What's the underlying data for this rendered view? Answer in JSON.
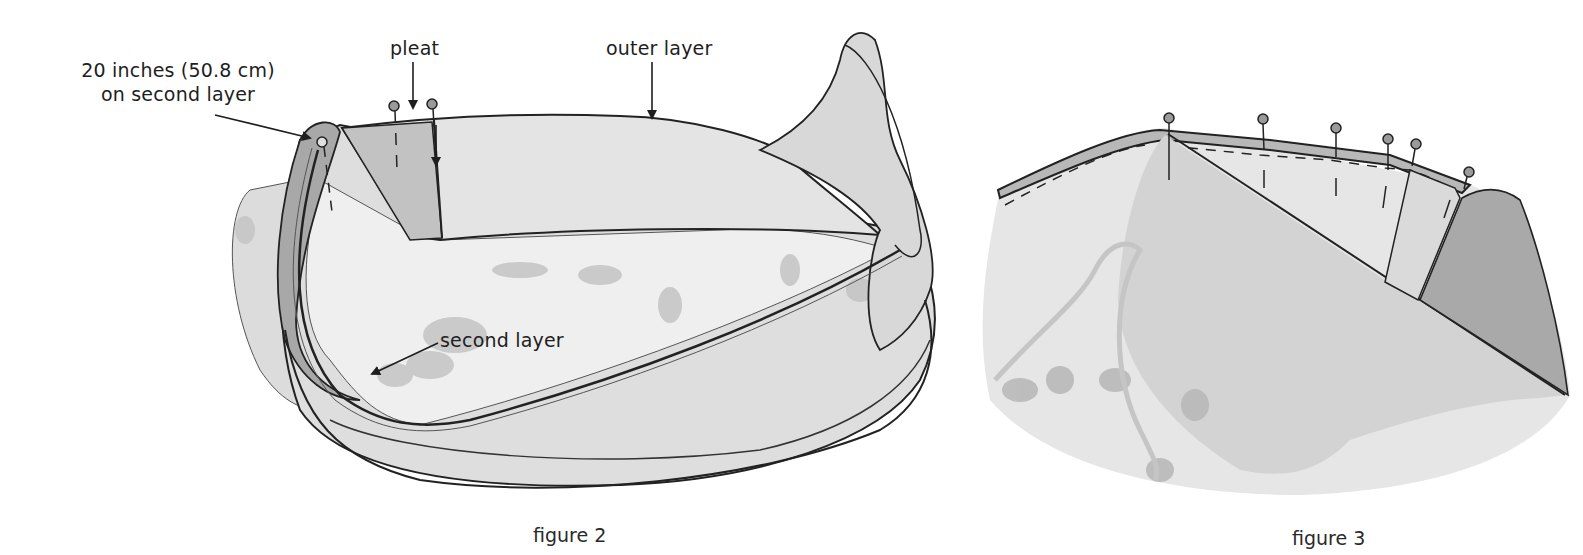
{
  "figures": [
    {
      "caption": "figure 2",
      "labels": {
        "measurement_line1": "20 inches (50.8 cm)",
        "measurement_line2": "on second layer",
        "pleat": "pleat",
        "outer_layer": "outer layer",
        "second_layer": "second layer"
      }
    },
    {
      "caption": "figure 3",
      "pin_count": 6
    }
  ],
  "colors": {
    "ink": "#1e1e1e",
    "fabric_light": "#e9e9e9",
    "fabric_mid": "#cfcfcf",
    "fabric_dark": "#a9a9a9",
    "pattern": "#bdbdbd",
    "pin_head": "#9a9a9a"
  }
}
